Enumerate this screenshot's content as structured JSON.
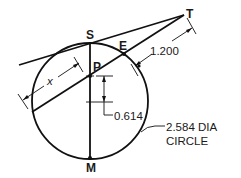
{
  "diagram": {
    "type": "geometry-construction",
    "points": {
      "S": "S",
      "E": "E",
      "T": "T",
      "P": "P",
      "M": "M"
    },
    "dimensions": {
      "tangent_segment": "1.200",
      "offset": "0.614",
      "chord_unknown": "x",
      "circle_line1": "2.584 DIA",
      "circle_line2": "CIRCLE"
    },
    "colors": {
      "line": "#111111",
      "background": "#ffffff"
    }
  }
}
